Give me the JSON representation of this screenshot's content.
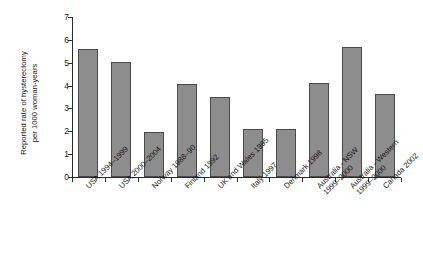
{
  "chart_data": {
    "type": "bar",
    "title": "",
    "xlabel": "",
    "ylabel": "Reported rate of hysterectomy per 1000 woman-years",
    "ylabel_lines": [
      "Reported rate of hysterectomy",
      "per 1000 woman-years"
    ],
    "ylim": [
      0,
      7
    ],
    "ytick_labels": [
      "0",
      "1",
      "2",
      "3",
      "4",
      "5",
      "6",
      "7"
    ],
    "ytick_values": [
      0,
      1,
      2,
      3,
      4,
      5,
      6,
      7
    ],
    "grid": false,
    "legend": false,
    "bar_color": "#8d8d8d",
    "bar_edge_color": "#4a4a4a",
    "axis_color": "#2b2b2b",
    "background": "#ffffff",
    "categories": [
      "USA 1994–1999",
      "USA 2000–2004",
      "Norway 1988–90",
      "Finland 1992",
      "UK and Wales 1995",
      "Italy 1997",
      "Denmark 1998",
      "Australia - NSW 1999–2000",
      "Australia - Western 1999–2000",
      "Canada 2002"
    ],
    "category_lines": [
      [
        "USA 1994–1999"
      ],
      [
        "USA 2000–2004"
      ],
      [
        "Norway 1988–90"
      ],
      [
        "Finland 1992"
      ],
      [
        "UK and Wales 1995"
      ],
      [
        "Italy 1997"
      ],
      [
        "Denmark 1998"
      ],
      [
        "Australia - NSW",
        "1999–2000"
      ],
      [
        "Australia - Western",
        "1999–2000"
      ],
      [
        "Canada 2002"
      ]
    ],
    "values": [
      5.6,
      5.05,
      1.95,
      4.05,
      3.5,
      2.1,
      2.08,
      4.1,
      5.68,
      3.65
    ]
  }
}
